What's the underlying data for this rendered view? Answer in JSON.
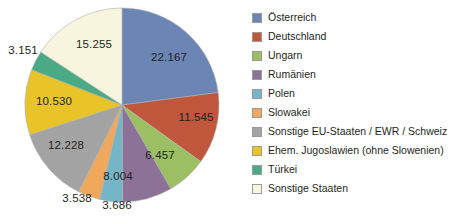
{
  "chart_data": {
    "type": "pie",
    "title": "",
    "legend_position": "right",
    "total": 96561,
    "categories": [
      "Österreich",
      "Deutschland",
      "Ungarn",
      "Rumänien",
      "Polen",
      "Slowakei",
      "Sonstige EU-Staaten / EWR / Schweiz",
      "Ehem. Jugoslawien (ohne Slowenien)",
      "Türkei",
      "Sonstige Staaten"
    ],
    "values": [
      22167,
      11545,
      6457,
      8004,
      3686,
      3538,
      12228,
      10530,
      3151,
      15255
    ],
    "value_labels": [
      "22.167",
      "11.545",
      "6.457",
      "8.004",
      "3.686",
      "3.538",
      "12.228",
      "10.530",
      "3.151",
      "15.255"
    ],
    "colors": [
      "#6b85b5",
      "#c0563c",
      "#9cbf63",
      "#8b7296",
      "#74b6c7",
      "#f0a85c",
      "#a3a3a3",
      "#e8c429",
      "#4aaa85",
      "#f7f5dd"
    ],
    "start_angle_deg": 0,
    "direction": "clockwise",
    "xlabel": "",
    "ylabel": "",
    "grid": false
  },
  "legend": {
    "items": [
      {
        "label": "Österreich",
        "color": "#6b85b5",
        "swatch_name": "legend-swatch-oesterreich"
      },
      {
        "label": "Deutschland",
        "color": "#c0563c",
        "swatch_name": "legend-swatch-deutschland"
      },
      {
        "label": "Ungarn",
        "color": "#9cbf63",
        "swatch_name": "legend-swatch-ungarn"
      },
      {
        "label": "Rumänien",
        "color": "#8b7296",
        "swatch_name": "legend-swatch-rumaenien"
      },
      {
        "label": "Polen",
        "color": "#74b6c7",
        "swatch_name": "legend-swatch-polen"
      },
      {
        "label": "Slowakei",
        "color": "#f0a85c",
        "swatch_name": "legend-swatch-slowakei"
      },
      {
        "label": "Sonstige EU-Staaten / EWR / Schweiz",
        "color": "#a3a3a3",
        "swatch_name": "legend-swatch-sonstige-eu"
      },
      {
        "label": "Ehem. Jugoslawien (ohne Slowenien)",
        "color": "#e8c429",
        "swatch_name": "legend-swatch-ehem-jugoslawien"
      },
      {
        "label": "Türkei",
        "color": "#4aaa85",
        "swatch_name": "legend-swatch-tuerkei"
      },
      {
        "label": "Sonstige Staaten",
        "color": "#f7f5dd",
        "swatch_name": "legend-swatch-sonstige-staaten"
      }
    ]
  },
  "geometry": {
    "center_x": 122,
    "center_y": 105,
    "radius": 97,
    "label_positions": [
      {
        "x": 169,
        "y": 57
      },
      {
        "x": 196,
        "y": 117
      },
      {
        "x": 160,
        "y": 155
      },
      {
        "x": 118,
        "y": 176
      },
      {
        "x": 117,
        "y": 205
      },
      {
        "x": 77,
        "y": 198
      },
      {
        "x": 66,
        "y": 145
      },
      {
        "x": 54,
        "y": 101
      },
      {
        "x": 23,
        "y": 50
      },
      {
        "x": 94,
        "y": 44
      }
    ]
  }
}
